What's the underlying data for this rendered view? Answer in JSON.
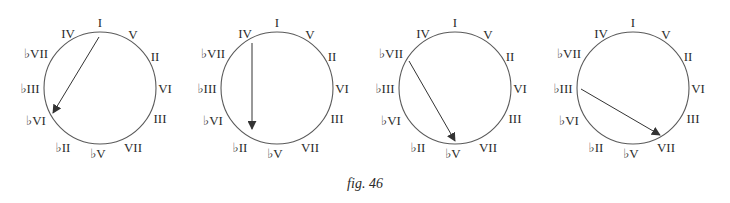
{
  "figure": {
    "caption": "fig. 46",
    "style": {
      "circle_color": "#5a5a5a",
      "arrow_color": "#333333",
      "label_color": "#2b2b2b",
      "radius": 56,
      "label_font_size": 13
    },
    "label_layout": [
      {
        "key": "I",
        "text": "I",
        "dx": 0,
        "dy": -66
      },
      {
        "key": "V",
        "text": "V",
        "dx": 33,
        "dy": -54
      },
      {
        "key": "II",
        "text": "II",
        "dx": 55,
        "dy": -32
      },
      {
        "key": "VI",
        "text": "VI",
        "dx": 65,
        "dy": 0
      },
      {
        "key": "III",
        "text": "III",
        "dx": 60,
        "dy": 30
      },
      {
        "key": "VII",
        "text": "VII",
        "dx": 33,
        "dy": 59
      },
      {
        "key": "bV",
        "text": "♭V",
        "dx": -2,
        "dy": 65
      },
      {
        "key": "bII",
        "text": "♭II",
        "dx": -37,
        "dy": 59
      },
      {
        "key": "bVI",
        "text": "♭VI",
        "dx": -64,
        "dy": 32
      },
      {
        "key": "bIII",
        "text": "♭III",
        "dx": -70,
        "dy": 0
      },
      {
        "key": "bVII",
        "text": "♭VII",
        "dx": -64,
        "dy": -35
      },
      {
        "key": "IV",
        "text": "IV",
        "dx": -32,
        "dy": -55
      }
    ],
    "circles": [
      {
        "id": "circle-1",
        "cx": 100,
        "cy": 88,
        "arrow": {
          "from": "I",
          "to": "♭VI",
          "x1": 99,
          "y1": 37,
          "x2": 53,
          "y2": 113
        }
      },
      {
        "id": "circle-2",
        "cx": 277,
        "cy": 88,
        "arrow": {
          "from": "IV",
          "to": "♭II",
          "x1": 252,
          "y1": 43,
          "x2": 252,
          "y2": 129
        }
      },
      {
        "id": "circle-3",
        "cx": 455,
        "cy": 88,
        "arrow": {
          "from": "♭VII",
          "to": "♭V",
          "x1": 409,
          "y1": 61,
          "x2": 455,
          "y2": 141
        }
      },
      {
        "id": "circle-4",
        "cx": 633,
        "cy": 88,
        "arrow": {
          "from": "♭III",
          "to": "VII",
          "x1": 581,
          "y1": 89,
          "x2": 660,
          "y2": 135
        }
      }
    ]
  }
}
